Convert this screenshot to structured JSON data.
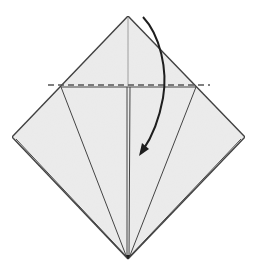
{
  "diagram": {
    "colors": {
      "paper": "#ececec",
      "edge": "#3a3a3a",
      "crease": "#8a8a8a",
      "fold_line": "#555555",
      "arrow": "#1e1e1e",
      "background": "#ffffff"
    },
    "elements": [
      {
        "name": "paper-diamond",
        "kind": "shape",
        "description": "Kite/diamond shaped folded paper"
      },
      {
        "name": "valley-fold-line",
        "kind": "fold-line",
        "style": "dashed",
        "description": "Horizontal valley fold line"
      },
      {
        "name": "center-crease",
        "kind": "crease",
        "description": "Vertical center crease in top triangle"
      },
      {
        "name": "inner-flap-edges",
        "kind": "edges",
        "description": "Flap edges converging to bottom point"
      },
      {
        "name": "fold-arrow",
        "kind": "arrow",
        "description": "Curved arrow showing top point folding down"
      }
    ]
  }
}
